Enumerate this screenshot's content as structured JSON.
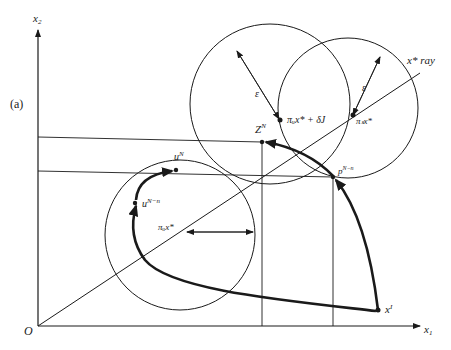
{
  "figure": {
    "panel_label": "(a)",
    "axes": {
      "x_label": "x",
      "x_sub": "1",
      "y_label": "x",
      "y_sub": "2",
      "origin_label": "O"
    },
    "ray_label": "x* ray",
    "epsilon_label": "ε",
    "points": {
      "pi_s_x_star": "πₛx*",
      "pi_u_x_star_delta": "πᵤx* + δJ",
      "Z_N": "Z",
      "Z_N_sup": "N",
      "p_N_n": "p",
      "p_N_n_sup": "N−n",
      "u_N": "u",
      "u_N_sup": "N",
      "u_N_n": "u",
      "u_N_n_sup": "N−n",
      "pi_u_x_star": "πᵤx*",
      "x_I": "x",
      "x_I_sup": "I"
    },
    "colors": {
      "ink": "#1a1a1a",
      "background": "#ffffff"
    }
  }
}
